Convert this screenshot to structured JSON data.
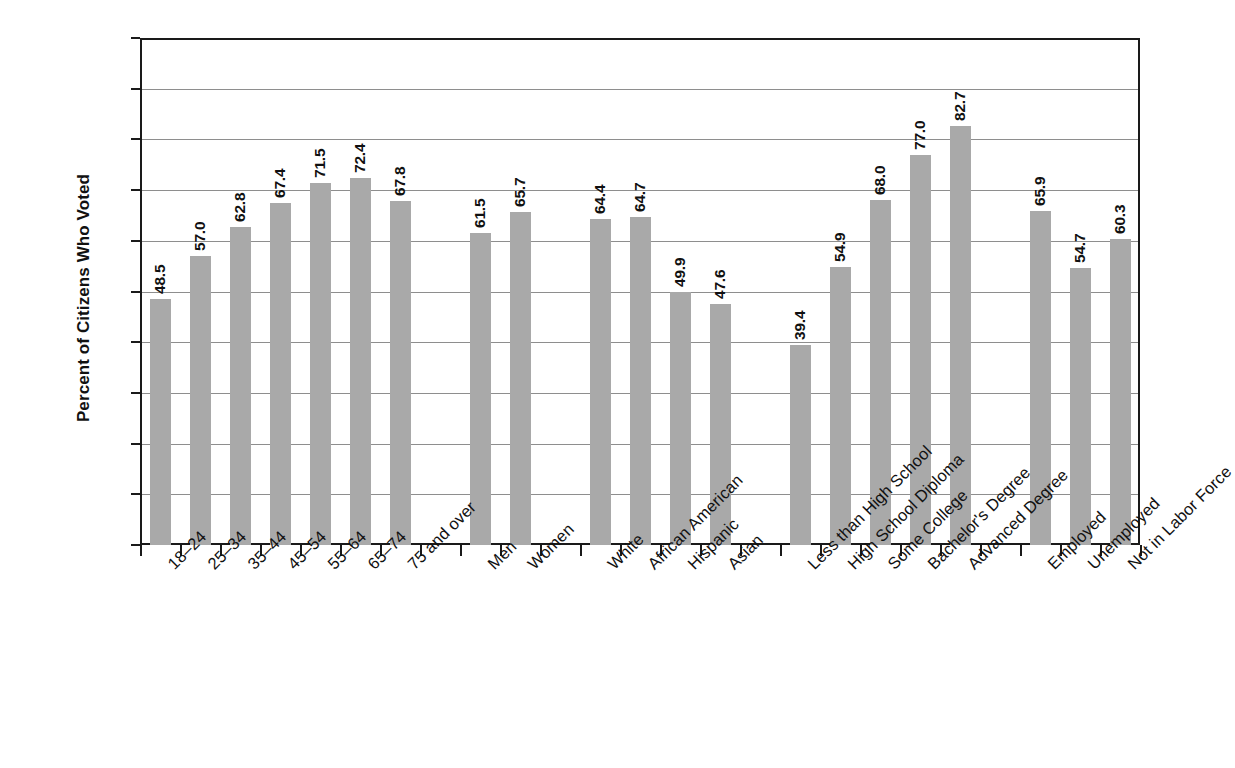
{
  "chart_data": {
    "type": "bar",
    "title": "",
    "xlabel": "",
    "ylabel": "Percent of Citizens Who Voted",
    "ylim": [
      0.0,
      100.0
    ],
    "ytick_labels": [
      "100.0",
      "90.0",
      "80.0",
      "70.0",
      "60.0",
      "50.0",
      "40.0",
      "30.0",
      "20.0",
      "10.0",
      "0.0"
    ],
    "ytick_values": [
      100.0,
      90.0,
      80.0,
      70.0,
      60.0,
      50.0,
      40.0,
      30.0,
      20.0,
      10.0,
      0.0
    ],
    "grid": true,
    "legend": "none",
    "bar_color": "#a9a9a9",
    "axis_color": "#1a1a1a",
    "gridline_color": "#8e8e8e",
    "categories": [
      "18–24",
      "25–34",
      "35–44",
      "45–54",
      "55–64",
      "65–74",
      "75 and over",
      "Men",
      "Women",
      "White",
      "African American",
      "Hispanic",
      "Asian",
      "Less than High School",
      "High School Diploma",
      "Some College",
      "Bachelor's Degree",
      "Advanced Degree",
      "Employed",
      "Unemployed",
      "Not in Labor Force"
    ],
    "values": [
      48.5,
      57.0,
      62.8,
      67.4,
      71.5,
      72.4,
      67.8,
      61.5,
      65.7,
      64.4,
      64.7,
      49.9,
      47.6,
      39.4,
      54.9,
      68.0,
      77.0,
      82.7,
      65.9,
      54.7,
      60.3
    ],
    "value_labels": [
      "48.5",
      "57.0",
      "62.8",
      "67.4",
      "71.5",
      "72.4",
      "67.8",
      "61.5",
      "65.7",
      "64.4",
      "64.7",
      "49.9",
      "47.6",
      "39.4",
      "54.9",
      "68.0",
      "77.0",
      "82.7",
      "65.9",
      "54.7",
      "60.3"
    ],
    "slots": [
      0,
      1,
      2,
      3,
      4,
      5,
      6,
      8,
      9,
      11,
      12,
      13,
      14,
      16,
      17,
      18,
      19,
      20,
      22,
      23,
      24
    ],
    "total_slots": 25,
    "groups": [
      {
        "name": "Age",
        "categories": [
          "18–24",
          "25–34",
          "35–44",
          "45–54",
          "55–64",
          "65–74",
          "75 and over"
        ]
      },
      {
        "name": "Sex",
        "categories": [
          "Men",
          "Women"
        ]
      },
      {
        "name": "Race and Hispanic Origin",
        "categories": [
          "White",
          "African American",
          "Hispanic",
          "Asian"
        ]
      },
      {
        "name": "Educational Attainment",
        "categories": [
          "Less than High School",
          "High School Diploma",
          "Some College",
          "Bachelor's Degree",
          "Advanced Degree"
        ]
      },
      {
        "name": "Employment Status",
        "categories": [
          "Employed",
          "Unemployed",
          "Not in Labor Force"
        ]
      }
    ]
  }
}
